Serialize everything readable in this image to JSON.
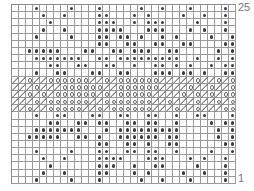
{
  "chart": {
    "columns": 32,
    "rows_count": 25,
    "legend": {
      ".": "empty",
      "o": "filled-dot",
      "/": "slash",
      "c": "open-circle"
    },
    "row_labels": {
      "top": "25",
      "bottom": "1"
    },
    "rows": [
      "...o....o...o.....o..o...o....o.",
      "....o..o....oo...o.o....o..o..o.",
      ".....o......ooo..o.ooo....o...o.",
      "....o..o....oooo...ooo...o.o..o.",
      "...o....o...oo.oo.o..o.o....o..o",
      "............oo..oo..oo..oo....oo",
      "..ooooo...oo..oo.ooo..oo.....o.o",
      "...ooooooo..oo.ooooooooo..o..o.o",
      ".....oo..oo..oo..o..oo.o.o..o.oo",
      "...o..oo...oo..oo...ooo.oo.o..oo",
      "//c//cccccc//c/cccccc/////c//c/c",
      "///c///cccccc//cccccc////c//c//c",
      "//c/c/cccccc/c/ccccc////c/c/c/cc",
      "///c/cccccc//ccccccc//c///c//c/c",
      "//c//ccccc//c/cccccc///c//c///cc",
      "...o..oo...oo..oo..oo..o..oo...o",
      ".....oo..oo.oo..oo.oo..o....o.oo",
      "...ooooooo...o.ooooooooo.....o.o",
      "..ooooo..oo.o..oooooo.oo.....o.o",
      "............oo..oo.o..oo......oo",
      "...o....o...oo..oo.oo..o....o..o",
      "....o..o....oooo...ooo...o.o..o.",
      ".....o......ooo..o..oo....o...o.",
      "....o..o....oo...o.o....o..o..o.",
      "...o....o...o.....o..o...o....o."
    ]
  }
}
